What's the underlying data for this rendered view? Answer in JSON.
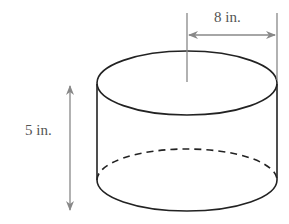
{
  "figure": {
    "shape": "cylinder",
    "labels": {
      "radius": "8 in.",
      "height": "5 in."
    },
    "colors": {
      "outline": "#222222",
      "dimension": "#888888",
      "text": "#555555"
    }
  }
}
